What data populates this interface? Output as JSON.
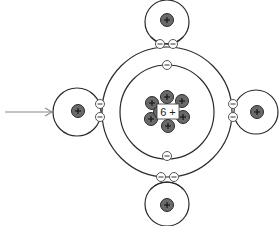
{
  "diagram": {
    "type": "covalent-bonding-diagram",
    "central_atom": {
      "nucleus_label": "6 +",
      "protons_shown": 7,
      "shells": [
        {
          "name": "inner",
          "electrons": 2
        },
        {
          "name": "outer",
          "electrons_shared": 8
        }
      ]
    },
    "hydrogen_atoms": [
      {
        "position": "top",
        "nucleus_symbol": "+",
        "shared_electrons": 2
      },
      {
        "position": "left",
        "nucleus_symbol": "+",
        "shared_electrons": 2
      },
      {
        "position": "right",
        "nucleus_symbol": "+",
        "shared_electrons": 2
      },
      {
        "position": "bottom",
        "nucleus_symbol": "+",
        "shared_electrons": 2
      }
    ],
    "pointer_arrow": {
      "points_to": "left hydrogen atom"
    },
    "symbols": {
      "proton": "+",
      "electron": "−"
    }
  }
}
